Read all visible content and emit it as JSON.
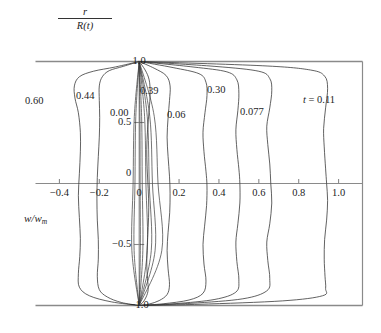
{
  "figure": {
    "y_axis_label_numerator": "r",
    "y_axis_label_denominator": "R(t)",
    "x_axis_label_main": "w/w",
    "x_axis_label_sub": "m"
  },
  "axes": {
    "x_ticks": [
      {
        "label": "−0.4",
        "value": -0.4
      },
      {
        "label": "−0.2",
        "value": -0.2
      },
      {
        "label": "0",
        "value": 0
      },
      {
        "label": "0.2",
        "value": 0.2
      },
      {
        "label": "0.4",
        "value": 0.4
      },
      {
        "label": "0.6",
        "value": 0.6
      },
      {
        "label": "0.8",
        "value": 0.8
      },
      {
        "label": "1.0",
        "value": 1.0
      }
    ],
    "y_ticks": [
      {
        "label": "1.0",
        "value": 1.0
      },
      {
        "label": "0.5",
        "value": 0.5
      },
      {
        "label": "0",
        "value": 0.0
      },
      {
        "label": "−0.5",
        "value": -0.5
      },
      {
        "label": "−1.0",
        "value": -1.0
      }
    ]
  },
  "curve_labels": [
    {
      "text": "0.60"
    },
    {
      "text": "0.44"
    },
    {
      "text": "0.00"
    },
    {
      "text": "0.39"
    },
    {
      "text": "0.06"
    },
    {
      "text": "0.30"
    },
    {
      "text": "0.077"
    },
    {
      "text": "t = 0.11"
    }
  ],
  "chart_data": {
    "type": "line",
    "title": "",
    "xlabel": "w/w_m",
    "ylabel": "r/R(t)",
    "xlim": [
      -0.52,
      1.12
    ],
    "ylim": [
      -1.0,
      1.0
    ],
    "grid": false,
    "legend": "inline-curve-labels",
    "note": "Normalised axial velocity profiles w/w_m versus normalised radius r/R(t) at several instants t. Each curve is a closed loop pinned at (0, 1.0) and (0, -1.0).",
    "series": [
      {
        "name": "t = 0.11",
        "label": "t = 0.11",
        "points": [
          [
            0.0,
            1.0
          ],
          [
            0.62,
            0.965
          ],
          [
            0.86,
            0.93
          ],
          [
            0.93,
            0.88
          ],
          [
            0.945,
            0.78
          ],
          [
            0.935,
            0.62
          ],
          [
            0.925,
            0.45
          ],
          [
            0.928,
            0.3
          ],
          [
            0.935,
            0.12
          ],
          [
            0.94,
            0.0
          ],
          [
            0.945,
            -0.14
          ],
          [
            0.94,
            -0.3
          ],
          [
            0.93,
            -0.46
          ],
          [
            0.928,
            -0.62
          ],
          [
            0.932,
            -0.76
          ],
          [
            0.935,
            -0.86
          ],
          [
            0.92,
            -0.92
          ],
          [
            0.72,
            -0.962
          ],
          [
            0.3,
            -0.99
          ],
          [
            0.0,
            -1.0
          ]
        ]
      },
      {
        "name": "0.077",
        "label": "0.077",
        "points": [
          [
            0.0,
            1.0
          ],
          [
            0.38,
            0.96
          ],
          [
            0.6,
            0.92
          ],
          [
            0.655,
            0.86
          ],
          [
            0.665,
            0.76
          ],
          [
            0.655,
            0.62
          ],
          [
            0.64,
            0.47
          ],
          [
            0.645,
            0.32
          ],
          [
            0.655,
            0.16
          ],
          [
            0.66,
            0.0
          ],
          [
            0.665,
            -0.16
          ],
          [
            0.655,
            -0.33
          ],
          [
            0.64,
            -0.48
          ],
          [
            0.645,
            -0.63
          ],
          [
            0.655,
            -0.78
          ],
          [
            0.64,
            -0.88
          ],
          [
            0.52,
            -0.945
          ],
          [
            0.26,
            -0.982
          ],
          [
            0.0,
            -1.0
          ]
        ]
      },
      {
        "name": "0.30",
        "label": "0.30",
        "points": [
          [
            0.0,
            1.0
          ],
          [
            0.27,
            0.955
          ],
          [
            0.44,
            0.915
          ],
          [
            0.49,
            0.85
          ],
          [
            0.5,
            0.74
          ],
          [
            0.495,
            0.6
          ],
          [
            0.485,
            0.44
          ],
          [
            0.49,
            0.28
          ],
          [
            0.5,
            0.12
          ],
          [
            0.505,
            0.0
          ],
          [
            0.505,
            -0.16
          ],
          [
            0.495,
            -0.33
          ],
          [
            0.485,
            -0.48
          ],
          [
            0.49,
            -0.64
          ],
          [
            0.5,
            -0.79
          ],
          [
            0.485,
            -0.89
          ],
          [
            0.38,
            -0.95
          ],
          [
            0.18,
            -0.985
          ],
          [
            0.0,
            -1.0
          ]
        ]
      },
      {
        "name": "0.06",
        "label": "0.06",
        "points": [
          [
            0.0,
            1.0
          ],
          [
            0.17,
            0.95
          ],
          [
            0.3,
            0.9
          ],
          [
            0.335,
            0.83
          ],
          [
            0.34,
            0.72
          ],
          [
            0.33,
            0.58
          ],
          [
            0.32,
            0.42
          ],
          [
            0.325,
            0.26
          ],
          [
            0.335,
            0.1
          ],
          [
            0.34,
            -0.02
          ],
          [
            0.338,
            -0.18
          ],
          [
            0.328,
            -0.35
          ],
          [
            0.32,
            -0.5
          ],
          [
            0.325,
            -0.66
          ],
          [
            0.335,
            -0.8
          ],
          [
            0.32,
            -0.9
          ],
          [
            0.25,
            -0.955
          ],
          [
            0.12,
            -0.986
          ],
          [
            0.0,
            -1.0
          ]
        ]
      },
      {
        "name": "0.39",
        "label": "0.39",
        "points": [
          [
            0.0,
            1.0
          ],
          [
            0.075,
            0.945
          ],
          [
            0.135,
            0.885
          ],
          [
            0.155,
            0.8
          ],
          [
            0.152,
            0.68
          ],
          [
            0.145,
            0.54
          ],
          [
            0.14,
            0.38
          ],
          [
            0.145,
            0.22
          ],
          [
            0.152,
            0.06
          ],
          [
            0.155,
            -0.08
          ],
          [
            0.153,
            -0.24
          ],
          [
            0.145,
            -0.4
          ],
          [
            0.14,
            -0.55
          ],
          [
            0.145,
            -0.7
          ],
          [
            0.152,
            -0.83
          ],
          [
            0.14,
            -0.91
          ],
          [
            0.1,
            -0.96
          ],
          [
            0.05,
            -0.988
          ],
          [
            0.0,
            -1.0
          ]
        ]
      },
      {
        "name": "0.00",
        "label": "0.00",
        "points": [
          [
            0.0,
            1.0
          ],
          [
            0.03,
            0.93
          ],
          [
            0.05,
            0.85
          ],
          [
            0.055,
            0.74
          ],
          [
            0.05,
            0.6
          ],
          [
            0.042,
            0.44
          ],
          [
            0.038,
            0.28
          ],
          [
            0.04,
            0.12
          ],
          [
            0.045,
            -0.04
          ],
          [
            0.048,
            -0.2
          ],
          [
            0.045,
            -0.36
          ],
          [
            0.04,
            -0.52
          ],
          [
            0.038,
            -0.66
          ],
          [
            0.042,
            -0.78
          ],
          [
            0.045,
            -0.87
          ],
          [
            0.035,
            -0.93
          ],
          [
            0.018,
            -0.975
          ],
          [
            0.0,
            -1.0
          ]
        ]
      },
      {
        "name": "0.44",
        "label": "0.44",
        "points": [
          [
            0.0,
            1.0
          ],
          [
            -0.08,
            0.96
          ],
          [
            -0.15,
            0.925
          ],
          [
            -0.185,
            0.875
          ],
          [
            -0.2,
            0.8
          ],
          [
            -0.2,
            0.68
          ],
          [
            -0.198,
            0.54
          ],
          [
            -0.2,
            0.38
          ],
          [
            -0.205,
            0.22
          ],
          [
            -0.21,
            0.05
          ],
          [
            -0.212,
            -0.12
          ],
          [
            -0.21,
            -0.3
          ],
          [
            -0.205,
            -0.46
          ],
          [
            -0.205,
            -0.62
          ],
          [
            -0.21,
            -0.76
          ],
          [
            -0.2,
            -0.87
          ],
          [
            -0.16,
            -0.93
          ],
          [
            -0.09,
            -0.975
          ],
          [
            0.0,
            -1.0
          ]
        ]
      },
      {
        "name": "0.60",
        "label": "0.60",
        "points": [
          [
            0.0,
            1.0
          ],
          [
            -0.12,
            0.955
          ],
          [
            -0.23,
            0.92
          ],
          [
            -0.3,
            0.875
          ],
          [
            -0.325,
            0.8
          ],
          [
            -0.322,
            0.7
          ],
          [
            -0.305,
            0.58
          ],
          [
            -0.295,
            0.42
          ],
          [
            -0.295,
            0.26
          ],
          [
            -0.3,
            0.08
          ],
          [
            -0.305,
            -0.1
          ],
          [
            -0.3,
            -0.28
          ],
          [
            -0.295,
            -0.45
          ],
          [
            -0.298,
            -0.6
          ],
          [
            -0.305,
            -0.74
          ],
          [
            -0.3,
            -0.85
          ],
          [
            -0.25,
            -0.92
          ],
          [
            -0.14,
            -0.97
          ],
          [
            0.0,
            -1.0
          ]
        ]
      }
    ]
  },
  "colors": {
    "curve": "#3a3a3a",
    "frame": "#8a8a8a",
    "axis": "#8a8a8a",
    "text": "#1d1d1d",
    "background": "#ffffff"
  }
}
